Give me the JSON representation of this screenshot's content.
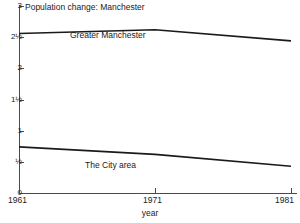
{
  "chart_data": {
    "type": "line",
    "title": "Population change: Manchester",
    "xlabel": "year",
    "ylabel": "",
    "x": [
      1961,
      1971,
      1981
    ],
    "xticklabels": [
      "1961",
      "1971",
      "1981"
    ],
    "xlim": [
      1961,
      1981
    ],
    "ylim": [
      0,
      3
    ],
    "yticks": [
      0,
      0.5,
      1,
      1.5,
      2,
      2.5,
      3
    ],
    "yticklabels": [
      "0",
      "½",
      "1",
      "1½",
      "2",
      "2½",
      "3"
    ],
    "grid": false,
    "legend_position": "inline-labels",
    "series": [
      {
        "name": "Greater Manchester",
        "values": [
          2.56,
          2.62,
          2.44
        ],
        "label_text": "Greater Manchester"
      },
      {
        "name": "The City area",
        "values": [
          0.74,
          0.62,
          0.43
        ],
        "label_text": "The City area"
      }
    ],
    "annotations": [
      "Population change: Manchester",
      "Greater Manchester",
      "The City area",
      "year"
    ],
    "colors": {
      "line": "#1a1a1a",
      "axis": "#4a4a4a",
      "background": "#ffffff",
      "text": "#1a1a1a"
    }
  },
  "yticklabels": {
    "t0": "0",
    "t1": "½",
    "t2": "1",
    "t3": "1½",
    "t4": "2",
    "t5": "2½",
    "t6": "3"
  },
  "xticklabels": {
    "t0": "1961",
    "t1": "1971",
    "t2": "1981"
  }
}
